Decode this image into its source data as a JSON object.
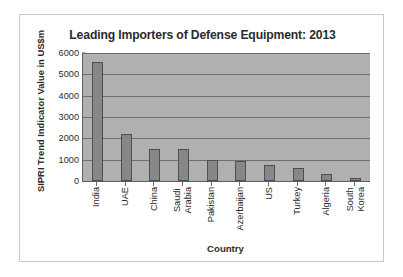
{
  "chart_data": {
    "type": "bar",
    "title": "Leading Importers of Defense Equipment: 2013",
    "xlabel": "Country",
    "ylabel": "SIPRI Trend Indicator Value in US$m",
    "categories": [
      "India",
      "UAE",
      "China",
      "Saudi Arabia",
      "Pakistan",
      "Azerbaijan",
      "US",
      "Turkey",
      "Algeria",
      "South Korea"
    ],
    "values": [
      5600,
      2200,
      1500,
      1480,
      980,
      950,
      740,
      620,
      350,
      160
    ],
    "ylim": [
      0,
      6000
    ],
    "yticks": [
      0,
      1000,
      2000,
      3000,
      4000,
      5000,
      6000
    ],
    "ytick_labels": [
      "0",
      "1000",
      "2000",
      "3000",
      "4000",
      "5000",
      "6000"
    ],
    "grid": true,
    "legend": false,
    "colors": {
      "bar_fill": "#878787",
      "bar_edge": "#4f4f4f",
      "plot_background": "#b0b0b0",
      "gridline": "#6f6f6f",
      "figure_background": "#ffffff",
      "text": "#2b2b2b"
    }
  }
}
